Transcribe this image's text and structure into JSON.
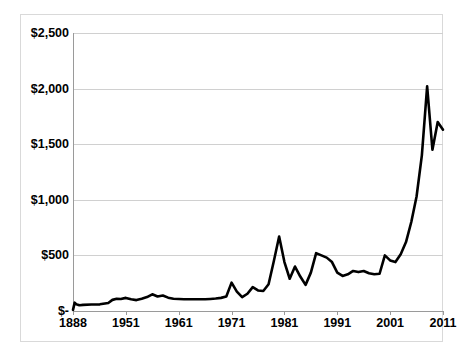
{
  "chart_data": {
    "type": "line",
    "title": "",
    "subtitle": "",
    "xlabel": "",
    "ylabel": "",
    "ylim": [
      0,
      2500
    ],
    "grid": true,
    "legend": "none",
    "y_ticks": [
      0,
      500,
      1000,
      1500,
      2000,
      2500
    ],
    "y_tick_labels": [
      "$-",
      "$500",
      "$1,000",
      "$1,500",
      "$2,000",
      "$2,500"
    ],
    "x_ticks": [
      1888,
      1951,
      1961,
      1971,
      1981,
      1991,
      2001,
      2011
    ],
    "x_tick_labels": [
      "1888",
      "1951",
      "1961",
      "1971",
      "1981",
      "1991",
      "2001",
      "2011"
    ],
    "line_color": "#000000",
    "line_width": 2.6,
    "series": [
      {
        "name": "price",
        "x": [
          1888,
          1890,
          1892,
          1894,
          1896,
          1900,
          1910,
          1920,
          1930,
          1935,
          1940,
          1945,
          1951,
          1952,
          1953,
          1954,
          1955,
          1956,
          1957,
          1958,
          1959,
          1960,
          1961,
          1962,
          1963,
          1964,
          1965,
          1966,
          1967,
          1968,
          1969,
          1970,
          1971,
          1972,
          1973,
          1974,
          1975,
          1976,
          1977,
          1978,
          1979,
          1980,
          1981,
          1982,
          1983,
          1984,
          1985,
          1986,
          1987,
          1988,
          1989,
          1990,
          1991,
          1992,
          1993,
          1994,
          1995,
          1996,
          1997,
          1998,
          1999,
          2000,
          2001,
          2002,
          2003,
          2004,
          2005,
          2006,
          2007,
          2008,
          2009,
          2010,
          2011
        ],
        "values": [
          10,
          75,
          60,
          55,
          52,
          55,
          58,
          60,
          72,
          100,
          110,
          108,
          118,
          105,
          98,
          110,
          125,
          150,
          130,
          140,
          120,
          110,
          108,
          105,
          105,
          105,
          105,
          105,
          108,
          112,
          118,
          130,
          255,
          175,
          125,
          155,
          215,
          185,
          180,
          240,
          450,
          670,
          440,
          290,
          400,
          310,
          235,
          345,
          520,
          500,
          480,
          440,
          345,
          315,
          330,
          360,
          350,
          360,
          340,
          330,
          335,
          500,
          455,
          440,
          510,
          620,
          800,
          1030,
          1400,
          2020,
          1450,
          1700,
          1630
        ]
      }
    ]
  },
  "accessibility": {
    "chart_role": "line-chart"
  }
}
